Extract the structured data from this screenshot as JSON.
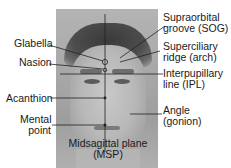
{
  "figure": {
    "type": "anatomical-landmarks-face",
    "labels_left": [
      {
        "id": "glabella",
        "text": "Glabella"
      },
      {
        "id": "nasion",
        "text": "Nasion"
      },
      {
        "id": "acanthion",
        "text": "Acanthion"
      },
      {
        "id": "mental_point",
        "line1": "Mental",
        "line2": "point"
      }
    ],
    "labels_right": [
      {
        "id": "sog",
        "line1": "Supraorbital",
        "line2": "groove (SOG)"
      },
      {
        "id": "superciliary",
        "line1": "Superciliary",
        "line2": "ridge (arch)"
      },
      {
        "id": "ipl",
        "line1": "Interpupillary",
        "line2": "line (IPL)"
      },
      {
        "id": "gonion",
        "line1": "Angle",
        "line2": "(gonion)"
      }
    ],
    "label_center": {
      "id": "msp",
      "line1": "Midsagittal plane",
      "line2": "(MSP)"
    }
  },
  "colors": {
    "line": "#222222",
    "text": "#1a1a1a",
    "background": "#ffffff"
  }
}
